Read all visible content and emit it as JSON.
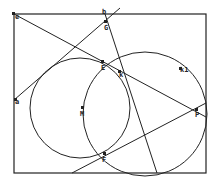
{
  "diagram": {
    "stroke_color": "#222222",
    "background": "#ffffff",
    "points": [
      {
        "id": "e",
        "label": "e"
      },
      {
        "id": "b",
        "label": "b"
      },
      {
        "id": "G",
        "label": "G"
      },
      {
        "id": "E",
        "label": "E"
      },
      {
        "id": "k",
        "label": "k"
      },
      {
        "id": "k1",
        "label": "k1"
      },
      {
        "id": "M",
        "label": "M"
      },
      {
        "id": "P",
        "label": "P"
      },
      {
        "id": "F",
        "label": "F"
      },
      {
        "id": "a",
        "label": "a"
      }
    ],
    "circles": [
      {
        "id": "left-circle",
        "center": "M",
        "through": [
          "E",
          "F"
        ]
      },
      {
        "id": "right-circle",
        "through": [
          "E",
          "F",
          "P",
          "k1"
        ]
      }
    ],
    "lines": [
      {
        "id": "line-e-P",
        "through": [
          "e",
          "E",
          "k",
          "P"
        ]
      },
      {
        "id": "line-a-b",
        "through": [
          "a",
          "G",
          "b"
        ]
      },
      {
        "id": "line-b-bottom",
        "through": [
          "b",
          "G",
          "k"
        ]
      },
      {
        "id": "line-F-P",
        "through": [
          "F",
          "P"
        ]
      }
    ]
  }
}
